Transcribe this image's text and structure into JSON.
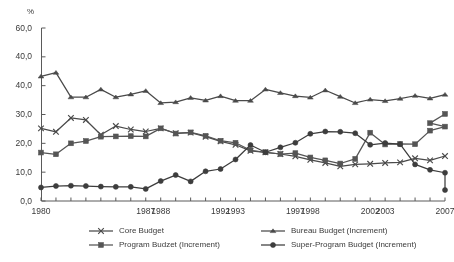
{
  "axes": {
    "unit_label": "%",
    "y_ticks": [
      "60,0",
      "40,0",
      "40,0",
      "30,0",
      "20,0",
      "10,0",
      "0,0"
    ],
    "y_values": [
      60,
      50,
      40,
      30,
      20,
      10,
      0
    ],
    "x_tick_labels": [
      "1980",
      "1987",
      "1988",
      "1992",
      "1993",
      "1997",
      "1998",
      "2002",
      "2003",
      "2007"
    ],
    "x_tick_years": [
      1980,
      1987,
      1988,
      1992,
      1993,
      1997,
      1998,
      2002,
      2003,
      2007
    ]
  },
  "legend": {
    "items": [
      {
        "label": "Core Budget",
        "marker": "cross-marker",
        "color": "#4a4a4a"
      },
      {
        "label": "Bureau Budget (Increment)",
        "marker": "dash-marker",
        "color": "#4a4a4a"
      },
      {
        "label": "Program Budzet (Increment)",
        "marker": "square-marker",
        "color": "#555555"
      },
      {
        "label": "Super-Program Budget (Increment)",
        "marker": "circle-marker",
        "color": "#3d3d3d"
      }
    ]
  },
  "chart_data": {
    "type": "line",
    "title": "",
    "subtitle": "",
    "xlabel": "",
    "ylabel": "%",
    "xlim": [
      1980,
      2007
    ],
    "ylim": [
      0,
      60
    ],
    "grid": false,
    "legend_position": "bottom",
    "x": [
      1980,
      1981,
      1982,
      1983,
      1984,
      1985,
      1986,
      1987,
      1988,
      1989,
      1990,
      1991,
      1992,
      1993,
      1994,
      1995,
      1996,
      1997,
      1998,
      1999,
      2000,
      2001,
      2002,
      2003,
      2004,
      2005,
      2006,
      2007
    ],
    "series": [
      {
        "name": "Core Budget",
        "marker": "cross-marker",
        "color": "#4a4a4a",
        "values": [
          25.2,
          24.0,
          28.8,
          28.1,
          23.0,
          26.0,
          24.8,
          24.1,
          25.2,
          23.5,
          23.7,
          22.3,
          20.7,
          19.5,
          17.4,
          16.9,
          16.3,
          15.5,
          14.3,
          13.2,
          12.0,
          12.7,
          12.9,
          13.2,
          13.4,
          14.8,
          14.1,
          15.6
        ]
      },
      {
        "name": "Bureau Budget (Increment)",
        "marker": "dash-marker",
        "color": "#4a4a4a",
        "values": [
          43.2,
          44.5,
          36.0,
          36.0,
          38.7,
          36.0,
          37.0,
          38.2,
          34.0,
          34.3,
          35.8,
          34.9,
          36.4,
          34.8,
          34.8,
          38.7,
          37.5,
          36.4,
          35.9,
          38.4,
          36.2,
          34.0,
          35.2,
          34.7,
          35.5,
          36.5,
          35.6,
          36.9
        ]
      },
      {
        "name": "Program Budzet (Increment)",
        "marker": "square-marker",
        "color": "#555555",
        "values": [
          16.8,
          16.2,
          20.0,
          20.8,
          22.3,
          22.4,
          22.5,
          22.4,
          25.2,
          23.4,
          23.8,
          22.6,
          20.9,
          20.2,
          17.6,
          16.9,
          16.3,
          16.6,
          15.1,
          14.1,
          13.0,
          14.6,
          23.7,
          19.6,
          19.8,
          19.7,
          24.4,
          25.8
        ]
      },
      {
        "name": "Super-Program Budget (Increment)",
        "marker": "circle-marker",
        "color": "#3d3d3d",
        "values": [
          4.7,
          5.2,
          5.3,
          5.2,
          5.0,
          4.9,
          4.9,
          4.2,
          6.9,
          9.0,
          6.8,
          10.3,
          11.1,
          14.4,
          19.4,
          16.9,
          18.6,
          20.2,
          23.3,
          24.1,
          24.0,
          23.5,
          19.5,
          20.1,
          19.7,
          12.7,
          10.8,
          9.8
        ]
      },
      {
        "name": "Program Budzet (Increment) tail",
        "marker": "square-marker",
        "color": "#555555",
        "values": [
          null,
          null,
          null,
          null,
          null,
          null,
          null,
          null,
          null,
          null,
          null,
          null,
          null,
          null,
          null,
          null,
          null,
          null,
          null,
          null,
          null,
          null,
          null,
          null,
          null,
          null,
          27.0,
          30.2
        ]
      },
      {
        "name": "Super-Program Budget (Increment) tail",
        "marker": "circle-marker",
        "color": "#3d3d3d",
        "values": [
          null,
          null,
          null,
          null,
          null,
          null,
          null,
          null,
          null,
          null,
          null,
          null,
          null,
          null,
          null,
          null,
          null,
          null,
          null,
          null,
          null,
          null,
          null,
          null,
          null,
          null,
          null,
          3.8
        ]
      }
    ]
  }
}
